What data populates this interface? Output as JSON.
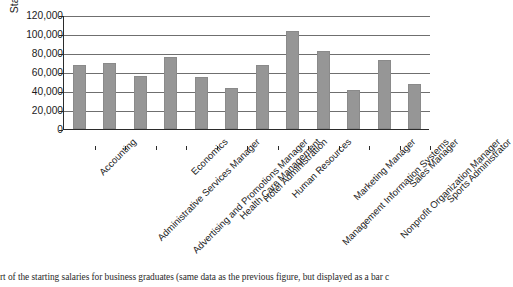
{
  "chart_data": {
    "type": "bar",
    "title": "",
    "xlabel": "",
    "ylabel": "Starting salary",
    "ylim": [
      0,
      120000
    ],
    "ytick_values": [
      120000,
      100000,
      80000,
      60000,
      40000,
      20000,
      0
    ],
    "ytick_labels": [
      "120,000",
      "100,000",
      "80,000",
      "60,000",
      "40,000",
      "20,000",
      "0"
    ],
    "grid": "horizontal",
    "legend": "none",
    "bar_color": "#969696",
    "categories": [
      "Accounting",
      "Administrative Services Manager",
      "Advertising and Promotions Manager",
      "Economics",
      "Health Care Management",
      "Hotel Administration",
      "Human Resources",
      "Management Information Systems",
      "Marketing Manager",
      "Nonprofit Organization Manager",
      "Sales Manager",
      "Sports Administrator"
    ],
    "values": [
      67000,
      70000,
      56000,
      76000,
      55000,
      43000,
      67000,
      103000,
      82000,
      41000,
      73000,
      47000
    ]
  },
  "caption": {
    "text": "rt of the starting salaries for business graduates (same data as the previous figure, but displayed as a bar c"
  }
}
